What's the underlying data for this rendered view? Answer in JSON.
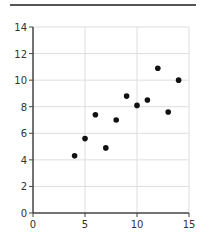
{
  "chart_data": {
    "type": "scatter",
    "title": "",
    "xlabel": "",
    "ylabel": "",
    "xlim": [
      0,
      15
    ],
    "ylim": [
      0,
      14
    ],
    "xticks": [
      0,
      5,
      10,
      15
    ],
    "yticks": [
      0,
      2,
      4,
      6,
      8,
      10,
      12,
      14
    ],
    "grid": true,
    "legend": null,
    "points": [
      {
        "x": 4,
        "y": 4.3
      },
      {
        "x": 5,
        "y": 5.6
      },
      {
        "x": 6,
        "y": 7.4
      },
      {
        "x": 7,
        "y": 4.9
      },
      {
        "x": 8,
        "y": 7.0
      },
      {
        "x": 9,
        "y": 8.8
      },
      {
        "x": 10,
        "y": 8.1
      },
      {
        "x": 11,
        "y": 8.5
      },
      {
        "x": 12,
        "y": 10.9
      },
      {
        "x": 13,
        "y": 7.6
      },
      {
        "x": 14,
        "y": 10.0
      }
    ],
    "colors": {
      "point": "#111111",
      "axis": "#444444",
      "grid": "#dddddd",
      "top_rule": "#555555"
    }
  }
}
